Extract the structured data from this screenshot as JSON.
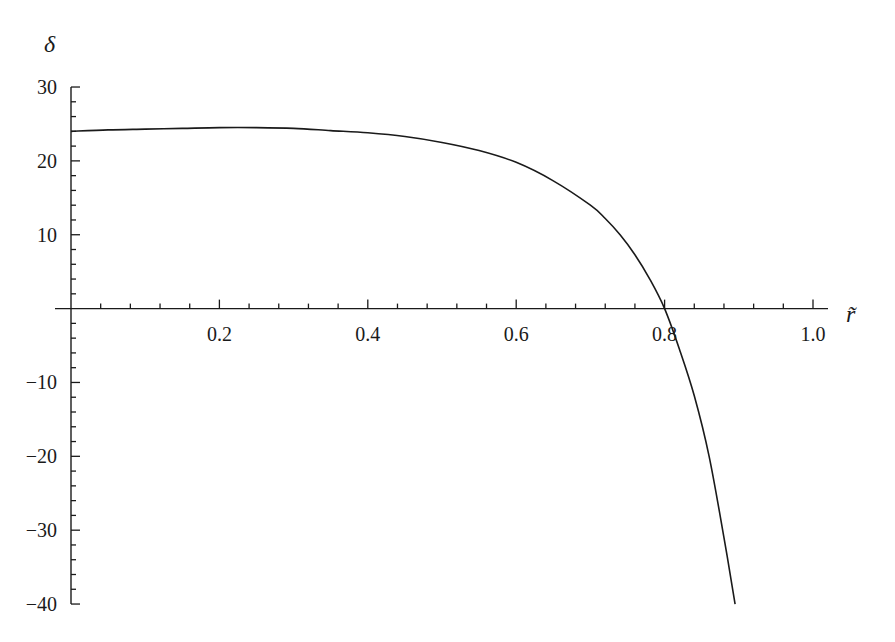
{
  "chart_data": {
    "type": "line",
    "title": "",
    "xlabel": "r̃",
    "ylabel": "δ",
    "xlim": [
      0,
      1.0
    ],
    "ylim": [
      -40,
      30
    ],
    "grid": false,
    "legend": null,
    "x_ticks": [
      0.2,
      0.4,
      0.6,
      0.8,
      1.0
    ],
    "x_tick_labels": [
      "0.2",
      "0.4",
      "0.6",
      "0.8",
      "1.0"
    ],
    "x_minor_step": 0.04,
    "y_ticks": [
      30,
      20,
      10,
      -10,
      -20,
      -30,
      -40
    ],
    "y_tick_labels": [
      "30",
      "20",
      "10",
      "−10",
      "−20",
      "−30",
      "−40"
    ],
    "y_minor_step": 2,
    "series": [
      {
        "name": "δ(r̃)",
        "color": "#1a1a1a",
        "x": [
          0,
          0.05,
          0.1,
          0.15,
          0.2,
          0.25,
          0.3,
          0.35,
          0.4,
          0.45,
          0.5,
          0.55,
          0.6,
          0.65,
          0.7,
          0.72,
          0.74,
          0.76,
          0.78,
          0.8,
          0.82,
          0.84,
          0.86,
          0.88,
          0.895
        ],
        "y": [
          24.0,
          24.2,
          24.3,
          24.4,
          24.5,
          24.5,
          24.4,
          24.1,
          23.8,
          23.3,
          22.5,
          21.4,
          19.8,
          17.3,
          14.0,
          12.2,
          10.0,
          7.3,
          4.0,
          0.0,
          -5.5,
          -11.8,
          -20.0,
          -31.0,
          -40.0
        ]
      }
    ]
  },
  "layout": {
    "x0_px": 71,
    "x_px_per_unit": 742,
    "y0_px": 308.6,
    "y_px_per_unit": 7.386,
    "x_axis_start_px": 55,
    "x_axis_end_px": 828
  }
}
